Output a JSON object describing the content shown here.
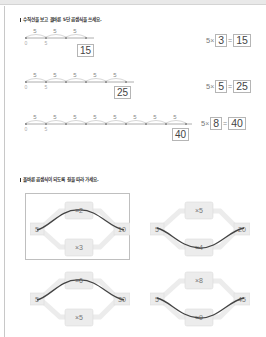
{
  "section1": {
    "instruction": "수직선을 보고 올바른 5단 곱셈식을 쓰세요.",
    "problems": [
      {
        "jumps": [
          "5",
          "5",
          "5"
        ],
        "ticks": [
          "0",
          "5"
        ],
        "answer_box": "15",
        "equation": {
          "base": "5",
          "times_sign": "×",
          "multiplier": "3",
          "equals_sign": "=",
          "product": "15"
        }
      },
      {
        "jumps": [
          "5",
          "5",
          "5",
          "5",
          "5"
        ],
        "ticks": [
          "0",
          "5"
        ],
        "answer_box": "25",
        "equation": {
          "base": "5",
          "times_sign": "×",
          "multiplier": "5",
          "equals_sign": "=",
          "product": "25"
        }
      },
      {
        "jumps": [
          "5",
          "5",
          "5",
          "5",
          "5",
          "5",
          "5",
          "5"
        ],
        "ticks": [
          "0",
          "5"
        ],
        "answer_box": "40",
        "equation": {
          "base": "5",
          "times_sign": "×",
          "multiplier": "8",
          "equals_sign": "=",
          "product": "40"
        }
      }
    ]
  },
  "section2": {
    "instruction": "올바른 곱셈식이 되도록 길을 따라 가세요.",
    "puzzles": [
      {
        "start": "5",
        "top": "×2",
        "bottom": "×3",
        "end": "10",
        "path": "top",
        "framed": true
      },
      {
        "start": "5",
        "top": "×5",
        "bottom": "×4",
        "end": "20",
        "path": "bottom",
        "framed": false
      },
      {
        "start": "5",
        "top": "×6",
        "bottom": "×5",
        "end": "30",
        "path": "top",
        "framed": false
      },
      {
        "start": "5",
        "top": "×8",
        "bottom": "×9",
        "end": "45",
        "path": "bottom",
        "framed": false
      }
    ]
  }
}
